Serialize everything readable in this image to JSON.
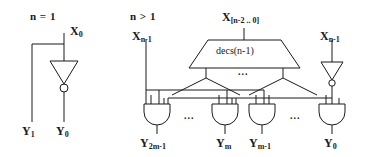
{
  "figure": {
    "type": "logic-circuit-diagram",
    "panels": [
      {
        "id": "base-case",
        "condition_label": "n = 1",
        "inputs": [
          {
            "name": "X",
            "sub": "0",
            "label": "X0"
          }
        ],
        "gates": [
          {
            "type": "inverter",
            "name": "inv-x0"
          }
        ],
        "outputs": [
          {
            "name": "Y",
            "sub": "1",
            "label": "Y1"
          },
          {
            "name": "Y",
            "sub": "0",
            "label": "Y0"
          }
        ]
      },
      {
        "id": "recursive-case",
        "condition_label": "n > 1",
        "inputs": [
          {
            "name": "X",
            "sub": "n-1",
            "label": "Xn-1",
            "position": "left"
          },
          {
            "name": "X",
            "sub": "[n-2 .. 0]",
            "label": "X[n-2 .. 0]",
            "position": "center"
          },
          {
            "name": "X",
            "sub": "n-1",
            "label": "Xn-1",
            "position": "right"
          }
        ],
        "block": {
          "shape": "trapezoid",
          "label": "decs(n-1)",
          "output_ellipsis": "..."
        },
        "gates": [
          {
            "type": "and",
            "name": "and-y2m-1"
          },
          {
            "type": "and",
            "name": "and-ym"
          },
          {
            "type": "and",
            "name": "and-ym-1"
          },
          {
            "type": "and",
            "name": "and-y0"
          },
          {
            "type": "inverter",
            "name": "inv-xn-1"
          }
        ],
        "gate_row_ellipses": [
          "...",
          "..."
        ],
        "outputs": [
          {
            "name": "Y",
            "sub": "2m-1",
            "label": "Y2m-1"
          },
          {
            "name": "Y",
            "sub": "m",
            "label": "Ym"
          },
          {
            "name": "Y",
            "sub": "m-1",
            "label": "Ym-1"
          },
          {
            "name": "Y",
            "sub": "0",
            "label": "Y0"
          }
        ]
      }
    ],
    "colors": {
      "ink": "#1a1a1a",
      "background": "#ffffff"
    }
  }
}
